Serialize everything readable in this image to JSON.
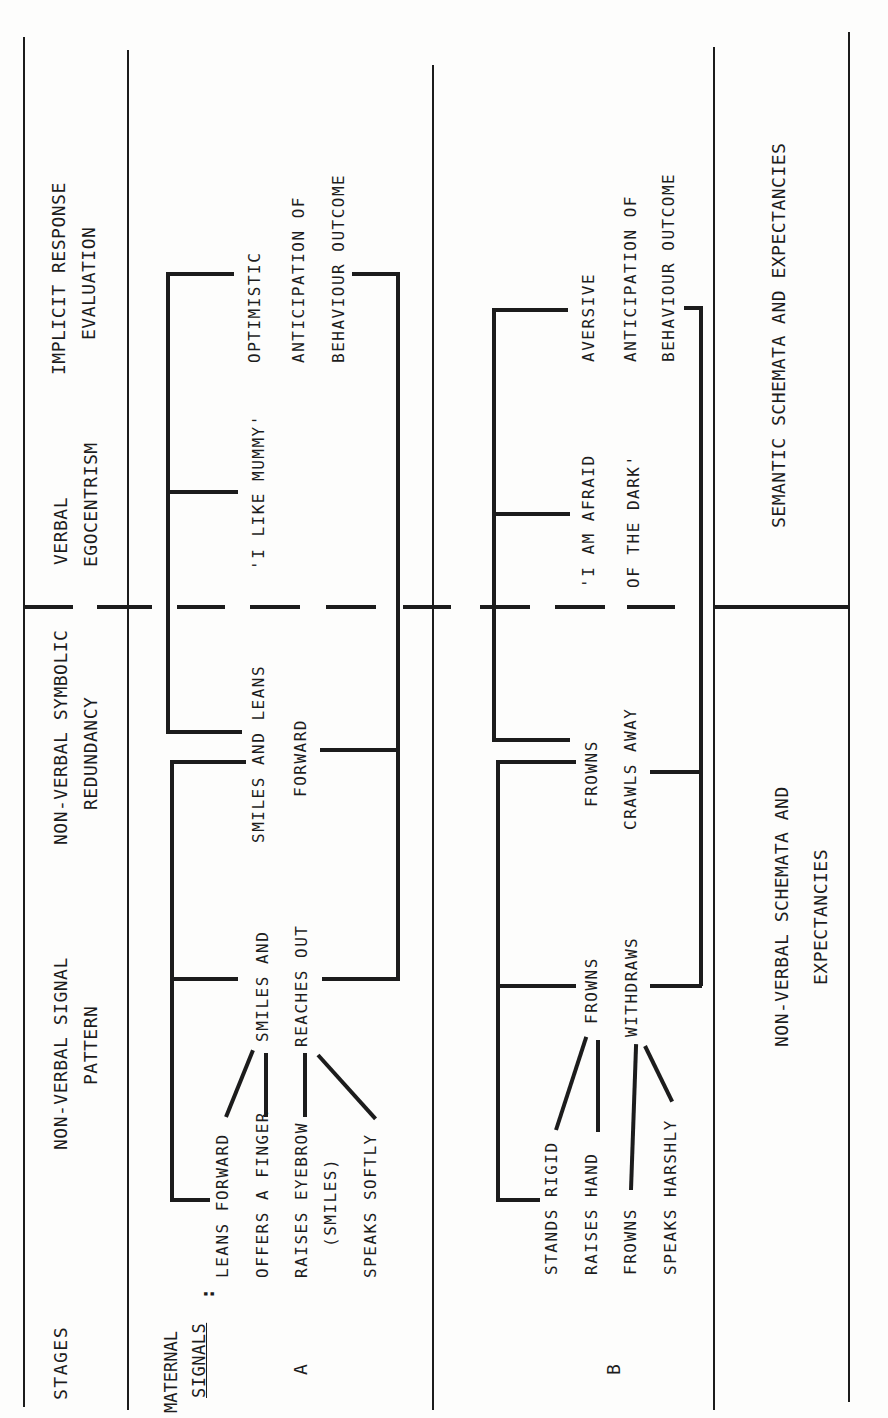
{
  "diagram": {
    "orientation": "rotated 90 degrees counter-clockwise (text reads bottom-to-top)",
    "columns": [
      {
        "id": "stages",
        "header": "STAGES"
      },
      {
        "id": "nvsp",
        "header": "NON-VERBAL SIGNAL\nPATTERN"
      },
      {
        "id": "nvsr",
        "header": "NON-VERBAL SYMBOLIC\nREDUNDANCY"
      },
      {
        "id": "ve",
        "header": "VERBAL\nEGOCENTRISM"
      },
      {
        "id": "ire",
        "header": "IMPLICIT RESPONSE\nEVALUATION"
      }
    ],
    "row_label_header": {
      "line1": "MATERNAL",
      "line2": "SIGNALS",
      "suffix": ":"
    },
    "rows": [
      {
        "label": "A",
        "maternal_signals": [
          "Leans forward",
          "Offers a finger",
          "Raises eyebrow",
          "(smiles)",
          "Speaks softly"
        ],
        "signal_pattern": [
          "Smiles and",
          "reaches out"
        ],
        "symbolic_redundancy": [
          "Smiles and leans",
          "forward"
        ],
        "verbal": "'I like Mummy'",
        "evaluation": [
          "Optimistic",
          "anticipation of",
          "behaviour outcome"
        ]
      },
      {
        "label": "B",
        "maternal_signals": [
          "Stands rigid",
          "Raises hand",
          "Frowns",
          "Speaks harshly"
        ],
        "signal_pattern": [
          "Frowns",
          "Withdraws"
        ],
        "symbolic_redundancy": [
          "Frowns",
          "Crawls away"
        ],
        "verbal": [
          "'I am afraid",
          "of the dark'"
        ],
        "evaluation": [
          "Aversive",
          "anticipation of",
          "behaviour outcome"
        ]
      }
    ],
    "footer": {
      "nonverbal": [
        "NON-VERBAL SCHEMATA AND",
        "EXPECTANCIES"
      ],
      "semantic": "SEMANTIC SCHEMATA AND EXPECTANCIES"
    }
  },
  "text": {
    "stages": "STAGES",
    "h_nvsp_1": "NON-VERBAL SIGNAL",
    "h_nvsp_2": "PATTERN",
    "h_nvsr_1": "NON-VERBAL SYMBOLIC",
    "h_nvsr_2": "REDUNDANCY",
    "h_ve_1": "VERBAL",
    "h_ve_2": "EGOCENTRISM",
    "h_ire_1": "IMPLICIT RESPONSE",
    "h_ire_2": "EVALUATION",
    "maternal": "MATERNAL",
    "signals": "SIGNALS",
    "colon": ":",
    "row_a": "A",
    "row_b": "B",
    "a_sig1": "Leans forward",
    "a_sig2": "Offers a finger",
    "a_sig3": "Raises eyebrow",
    "a_sig3b": "(smiles)",
    "a_sig4": "Speaks softly",
    "a_pat1": "Smiles and",
    "a_pat2": "reaches out",
    "a_red1": "Smiles and leans",
    "a_red2": "forward",
    "a_verb": "'I like Mummy'",
    "a_ev1": "Optimistic",
    "a_ev2": "anticipation of",
    "a_ev3": "behaviour outcome",
    "b_sig1": "Stands rigid",
    "b_sig2": "Raises hand",
    "b_sig3": "Frowns",
    "b_sig4": "Speaks harshly",
    "b_pat1": "Frowns",
    "b_pat2": "Withdraws",
    "b_red1": "Frowns",
    "b_red2": "Crawls away",
    "b_verb1": "'I am afraid",
    "b_verb2": "of the dark'",
    "b_ev1": "Aversive",
    "b_ev2": "anticipation of",
    "b_ev3": "behaviour outcome",
    "f_nv1": "NON-VERBAL SCHEMATA AND",
    "f_nv2": "EXPECTANCIES",
    "f_sem": "SEMANTIC SCHEMATA AND EXPECTANCIES"
  }
}
